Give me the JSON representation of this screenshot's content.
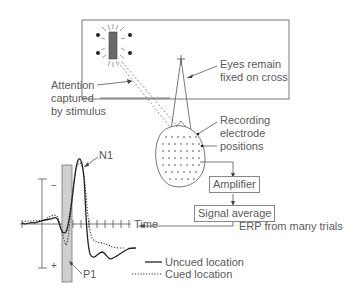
{
  "diagram": {
    "labels": {
      "attention": [
        "Attention",
        "captured",
        "by stimulus"
      ],
      "eyes": [
        "Eyes remain",
        "fixed on cross"
      ],
      "electrodes": [
        "Recording",
        "electrode",
        "positions"
      ],
      "amplifier": "Amplifier",
      "signal_average": "Signal average",
      "erp": "ERP from many trials",
      "time": "Time",
      "n1": "N1",
      "p1": "P1",
      "minus": "−",
      "plus": "+"
    },
    "legend": [
      {
        "label": "Uncued location",
        "style": "solid"
      },
      {
        "label": "Cued location",
        "style": "dotted"
      }
    ],
    "colors": {
      "line": "#333333",
      "frame": "#777777",
      "stimulus": "#666666",
      "p1_band": "#cccccc"
    }
  }
}
